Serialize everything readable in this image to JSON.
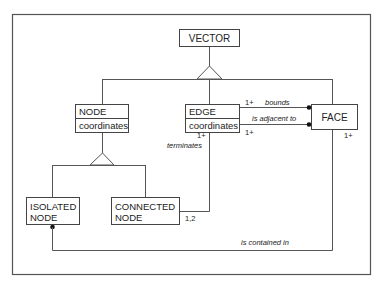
{
  "diagram": {
    "type": "class-diagram",
    "classes": {
      "vector": {
        "name": "VECTOR"
      },
      "node": {
        "name": "NODE",
        "attribute": "coordinates"
      },
      "edge": {
        "name": "EDGE",
        "attribute": "coordinates"
      },
      "face": {
        "name": "FACE"
      },
      "isolated_node": {
        "line1": "ISOLATED",
        "line2": "NODE"
      },
      "connected_node": {
        "line1": "CONNECTED",
        "line2": "NODE"
      }
    },
    "generalizations": [
      {
        "parent": "VECTOR",
        "children": [
          "NODE",
          "EDGE",
          "FACE"
        ]
      },
      {
        "parent": "NODE",
        "children": [
          "ISOLATED NODE",
          "CONNECTED NODE"
        ]
      }
    ],
    "associations": {
      "bounds": {
        "label": "bounds",
        "multiplicity": "1+"
      },
      "adjacent": {
        "label": "is adjacent to",
        "multiplicity": "1+"
      },
      "terminates": {
        "label": "terminates",
        "edge_multiplicity": "1+",
        "node_multiplicity": "1,2"
      },
      "contained": {
        "label": "is contained in",
        "face_multiplicity": "1+"
      }
    },
    "colors": {
      "line": "#555555",
      "text": "#222222",
      "background": "#ffffff"
    }
  }
}
